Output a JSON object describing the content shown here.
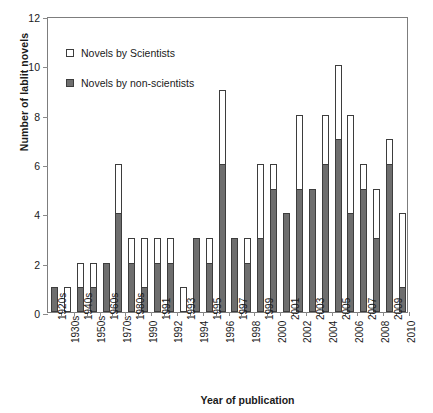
{
  "chart_data": {
    "type": "bar",
    "stacked": true,
    "title": "",
    "xlabel": "Year of publication",
    "ylabel": "Number of lablit novels",
    "ylim": [
      0,
      12
    ],
    "yticks": [
      0,
      2,
      4,
      6,
      8,
      10,
      12
    ],
    "grid": false,
    "legend_position": "inside-top-left",
    "categories": [
      "1920s",
      "1930s",
      "1940s",
      "1950s",
      "1960s",
      "1970s",
      "1980s",
      "1990",
      "1991",
      "1992",
      "1993",
      "1994",
      "1995",
      "1996",
      "1997",
      "1998",
      "1999",
      "2000",
      "2001",
      "2002",
      "2003",
      "2004",
      "2005",
      "2006",
      "2007",
      "2008",
      "2009",
      "2010"
    ],
    "series": [
      {
        "name": "Novels by non-scientists",
        "color": "#6e6e6e",
        "values": [
          1,
          0,
          1,
          1,
          2,
          4,
          2,
          1,
          2,
          2,
          0,
          3,
          2,
          6,
          3,
          2,
          3,
          5,
          4,
          5,
          5,
          6,
          7,
          4,
          5,
          3,
          6,
          1
        ]
      },
      {
        "name": "Novels by Scientists",
        "color": "#ffffff",
        "values": [
          0,
          1,
          1,
          1,
          0,
          2,
          1,
          2,
          1,
          1,
          1,
          0,
          1,
          3,
          0,
          1,
          3,
          1,
          0,
          3,
          0,
          2,
          3,
          4,
          1,
          2,
          1,
          3
        ]
      }
    ],
    "totals": [
      1,
      1,
      2,
      2,
      2,
      6,
      3,
      3,
      3,
      3,
      1,
      3,
      3,
      9,
      3,
      3,
      6,
      6,
      4,
      8,
      5,
      8,
      10,
      8,
      6,
      5,
      7,
      4
    ],
    "annotations": []
  },
  "legend": {
    "items": [
      {
        "label": "Novels by Scientists",
        "key": "light-square-icon"
      },
      {
        "label": "Novels by non-scientists",
        "key": "dark-square-icon"
      }
    ]
  }
}
